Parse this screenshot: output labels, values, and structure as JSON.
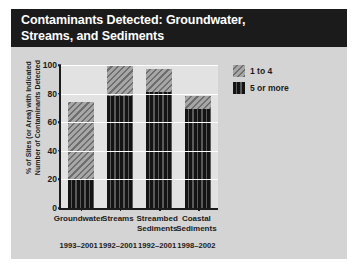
{
  "figure": {
    "title": "Contaminants Detected: Groundwater,\nStreams, and Sediments",
    "background_color": "#d4d4d4",
    "title_background_color": "#1b1b1b",
    "title_text_color": "#ffffff",
    "plot_background_color": "#e2e2e2"
  },
  "legend": {
    "position": "top-right",
    "items": [
      {
        "label": "1 to 4",
        "swatch": "diagonal-hatch-grey",
        "color": "#8c8c8c"
      },
      {
        "label": "5 or more",
        "swatch": "vertical-stripe-dark",
        "color": "#1b1b1b"
      }
    ]
  },
  "chart_data": {
    "type": "bar",
    "stacked": true,
    "title": "Contaminants Detected: Groundwater, Streams, and Sediments",
    "xlabel": "",
    "ylabel": "% of Sites (or Area) with Indicated\nNumber of Contaminants Detected",
    "ylim": [
      0,
      100
    ],
    "yticks": [
      0,
      20,
      40,
      60,
      80,
      100
    ],
    "ytick_labels": [
      "0",
      "20",
      "40",
      "60",
      "80",
      "100"
    ],
    "grid": true,
    "categories": [
      "Groundwater",
      "Streams",
      "Streambed\nSediments",
      "Coastal\nSediments"
    ],
    "category_sublabels": [
      "1993–2001",
      "1992–2001",
      "1992–2001",
      "1998–2002"
    ],
    "series": [
      {
        "name": "5 or more",
        "values": [
          20,
          78,
          81,
          69
        ]
      },
      {
        "name": "1 to 4",
        "values": [
          54,
          22,
          16,
          9
        ]
      }
    ],
    "totals": [
      74,
      100,
      97,
      78
    ]
  }
}
